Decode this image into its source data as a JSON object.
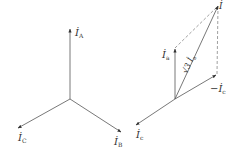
{
  "diagram": {
    "left": {
      "title": "three-phase star currents",
      "vectors": [
        {
          "name": "I_A",
          "symbol": "İ",
          "subscript": "A",
          "from": [
            70,
            99
          ],
          "to": [
            70,
            28
          ]
        },
        {
          "name": "I_C",
          "symbol": "İ",
          "subscript": "C",
          "from": [
            70,
            99
          ],
          "to": [
            17,
            129
          ]
        },
        {
          "name": "I_B",
          "symbol": "İ",
          "subscript": "B",
          "from": [
            70,
            99
          ],
          "to": [
            122,
            133
          ]
        }
      ]
    },
    "right": {
      "title": "phasor sum",
      "vectors": [
        {
          "name": "I_a",
          "symbol": "İ",
          "subscript": "a",
          "from": [
            175,
            99
          ],
          "to": [
            175,
            48
          ]
        },
        {
          "name": "-I_c",
          "symbol": "−İ",
          "subscript": "c",
          "from": [
            175,
            99
          ],
          "to": [
            217,
            74
          ]
        },
        {
          "name": "I_c",
          "symbol": "İ",
          "subscript": "c",
          "from": [
            175,
            99
          ],
          "to": [
            135,
            126
          ]
        },
        {
          "name": "resultant",
          "symbol": "İ",
          "subscript": "",
          "from": [
            175,
            99
          ],
          "to": [
            218,
            5
          ]
        }
      ],
      "resultant_label": "√3 İ",
      "resultant_label_sub": "a",
      "dashed": [
        {
          "from": [
            175,
            48
          ],
          "to": [
            218,
            5
          ]
        },
        {
          "from": [
            217,
            74
          ],
          "to": [
            218,
            5
          ]
        }
      ]
    },
    "labels": {
      "IA_main": "İ",
      "IA_sub": "A",
      "IC_main": "İ",
      "IC_sub": "C",
      "IB_main": "İ",
      "IB_sub": "B",
      "Ia_main": "İ",
      "Ia_sub": "a",
      "negIc_main": "−İ",
      "negIc_sub": "c",
      "Ic_main": "İ",
      "Ic_sub": "c",
      "res_main": "İ",
      "sqrt3_main": "√3 İ",
      "sqrt3_sub": "a"
    },
    "colors": {
      "line": "#555555",
      "dashed": "#777777",
      "text": "#333333"
    }
  }
}
